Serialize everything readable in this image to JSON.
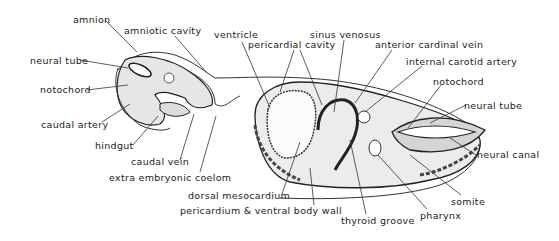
{
  "figure": {
    "type": "anatomical-diagram",
    "labels": [
      {
        "id": "amnion",
        "text": "amnion",
        "x": 73,
        "y": 15
      },
      {
        "id": "amniotic-cavity",
        "text": "amniotic cavity",
        "x": 124,
        "y": 26
      },
      {
        "id": "neural-tube-left",
        "text": "neural tube",
        "x": 30,
        "y": 57
      },
      {
        "id": "notochord-left",
        "text": "notochord",
        "x": 40,
        "y": 86
      },
      {
        "id": "caudal-artery",
        "text": "caudal artery",
        "x": 41,
        "y": 121
      },
      {
        "id": "hindgut",
        "text": "hindgut",
        "x": 95,
        "y": 142
      },
      {
        "id": "caudal-vein",
        "text": "caudal vein",
        "x": 131,
        "y": 158
      },
      {
        "id": "extra-embryonic-coelom",
        "text": "extra embryonic coelom",
        "x": 109,
        "y": 174
      },
      {
        "id": "ventricle",
        "text": "ventricle",
        "x": 214,
        "y": 30
      },
      {
        "id": "pericardial-cavity",
        "text": "pericardial cavity",
        "x": 248,
        "y": 40
      },
      {
        "id": "sinus-venosus",
        "text": "sinus venosus",
        "x": 310,
        "y": 30
      },
      {
        "id": "anterior-cardinal-vein",
        "text": "anterior cardinal vein",
        "x": 375,
        "y": 40
      },
      {
        "id": "internal-carotid-artery",
        "text": "internal carotid artery",
        "x": 406,
        "y": 57
      },
      {
        "id": "notochord-right",
        "text": "notochord",
        "x": 433,
        "y": 77
      },
      {
        "id": "neural-tube-right",
        "text": "neural tube",
        "x": 464,
        "y": 101
      },
      {
        "id": "neural-canal",
        "text": "neural canal",
        "x": 477,
        "y": 150
      },
      {
        "id": "somite",
        "text": "somite",
        "x": 451,
        "y": 197
      },
      {
        "id": "pharynx",
        "text": "pharynx",
        "x": 420,
        "y": 211
      },
      {
        "id": "thyroid-groove",
        "text": "thyroid groove",
        "x": 341,
        "y": 216
      },
      {
        "id": "pericardium-ventral-body-wall",
        "text": "pericardium & ventral body wall",
        "x": 180,
        "y": 206
      },
      {
        "id": "dorsal-mesocardium",
        "text": "dorsal mesocardium",
        "x": 188,
        "y": 191
      }
    ]
  }
}
